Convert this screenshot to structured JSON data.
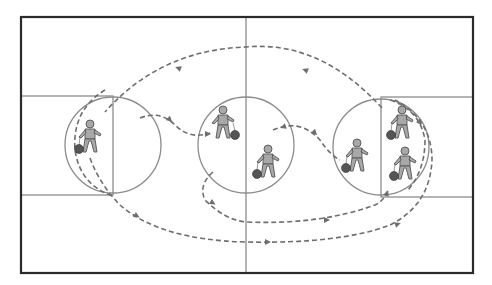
{
  "diagram": {
    "type": "basketball-drill",
    "colors": {
      "background": "#ffffff",
      "court_border": "#2a2a2a",
      "court_lines": "#8c8c8c",
      "path": "#6e6e6e",
      "player_fill": "#a8a8a8",
      "player_stroke": "#555555",
      "ball": "#555555"
    },
    "court": {
      "x": 21,
      "y": 17,
      "width": 452,
      "height": 256,
      "midline_x": 246
    },
    "lanes": [
      {
        "side": "left",
        "x": 21,
        "y": 96,
        "width": 92,
        "height": 99
      },
      {
        "side": "right",
        "x": 381,
        "y": 97,
        "width": 92,
        "height": 100
      }
    ],
    "circles": [
      {
        "name": "left-key-circle",
        "cx": 113,
        "cy": 145,
        "r": 48
      },
      {
        "name": "center-circle",
        "cx": 246,
        "cy": 145,
        "r": 48
      },
      {
        "name": "right-key-circle",
        "cx": 381,
        "cy": 147,
        "r": 48
      }
    ],
    "players": [
      {
        "id": "p1",
        "x": 90,
        "y": 133,
        "ball": "left"
      },
      {
        "id": "p2",
        "x": 223,
        "y": 119,
        "ball": "right"
      },
      {
        "id": "p3",
        "x": 268,
        "y": 158,
        "ball": "left"
      },
      {
        "id": "p4",
        "x": 357,
        "y": 152,
        "ball": "left"
      },
      {
        "id": "p5",
        "x": 402,
        "y": 119,
        "ball": "left"
      },
      {
        "id": "p6",
        "x": 405,
        "y": 160,
        "ball": "left"
      }
    ],
    "paths": [
      {
        "name": "top-arc-pass",
        "d": "M 382 108 Q 320 40 246 47 Q 160 50 105 112",
        "arrows": [
          [
            305,
            70,
            200
          ],
          [
            178,
            68,
            200
          ]
        ]
      },
      {
        "name": "left-curl",
        "d": "M 105 90 Q 72 110 75 150 Q 80 185 113 196",
        "arrows": []
      },
      {
        "name": "left-cut-to-center",
        "d": "M 140 118 Q 160 110 175 125 Q 190 140 210 133",
        "arrows": [
          [
            170,
            120,
            45
          ],
          [
            208,
            134,
            0
          ]
        ]
      },
      {
        "name": "left-drive-bottom",
        "d": "M 90 158 Q 100 185 120 205 Q 160 240 246 242 Q 340 244 390 225 Q 430 205 432 160 Q 432 120 395 100",
        "arrows": [
          [
            137,
            216,
            30
          ],
          [
            268,
            242,
            0
          ],
          [
            398,
            224,
            -20
          ]
        ]
      },
      {
        "name": "center-curl-bottom",
        "d": "M 213 172 Q 198 185 205 200 Q 225 220 246 222 Q 320 225 375 205 Q 385 200 388 190",
        "arrows": [
          [
            213,
            203,
            30
          ],
          [
            327,
            220,
            0
          ],
          [
            387,
            193,
            -70
          ]
        ]
      },
      {
        "name": "center-right-hook",
        "d": "M 273 130 Q 300 118 320 140 Q 330 155 340 160",
        "arrows": [
          [
            283,
            127,
            160
          ],
          [
            315,
            133,
            45
          ]
        ]
      },
      {
        "name": "right-baseline-curl",
        "d": "M 390 100 Q 420 110 425 140 Q 425 170 408 190",
        "arrows": [
          [
            420,
            123,
            60
          ]
        ]
      }
    ]
  }
}
